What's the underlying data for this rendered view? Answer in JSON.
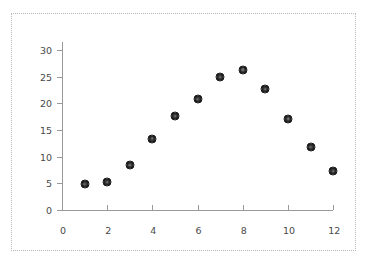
{
  "chart_data": {
    "type": "scatter",
    "title": "",
    "subtitle": "",
    "xlabel": "",
    "ylabel": "",
    "x": [
      1,
      2,
      3,
      4,
      5,
      6,
      7,
      8,
      9,
      10,
      11,
      12
    ],
    "values": [
      4.8,
      5.2,
      8.4,
      13.4,
      17.6,
      20.8,
      24.9,
      26.3,
      22.6,
      17.1,
      11.8,
      7.3
    ],
    "series": [
      {
        "name": "series-1",
        "x": [
          1,
          2,
          3,
          4,
          5,
          6,
          7,
          8,
          9,
          10,
          11,
          12
        ],
        "values": [
          4.8,
          5.2,
          8.4,
          13.4,
          17.6,
          20.8,
          24.9,
          26.3,
          22.6,
          17.1,
          11.8,
          7.3
        ]
      }
    ],
    "xlim": [
      0,
      12
    ],
    "ylim": [
      0,
      32
    ],
    "xticks": [
      0,
      2,
      4,
      6,
      8,
      10,
      12
    ],
    "yticks": [
      0,
      5,
      10,
      15,
      20,
      25,
      30
    ],
    "xticklabels": [
      "0",
      "2",
      "4",
      "6",
      "8",
      "10",
      "12"
    ],
    "yticklabels": [
      "0",
      "5",
      "10",
      "15",
      "20",
      "25",
      "30"
    ],
    "grid": false,
    "legend": false,
    "legend_position": "none",
    "marker_color": "#2b2b2b",
    "axis_color": "#9a9a9a",
    "tick_label_color": "#4a4a4a",
    "background_color": "#ffffff",
    "frame_border_color": "#b9b9b9"
  },
  "geometry": {
    "x_origin_px": 62,
    "y_origin_px": 210,
    "px_per_x_unit": 22.6,
    "px_per_y_unit": 5.333,
    "y_axis_top_px": 42,
    "x_axis_right_px": 333
  }
}
